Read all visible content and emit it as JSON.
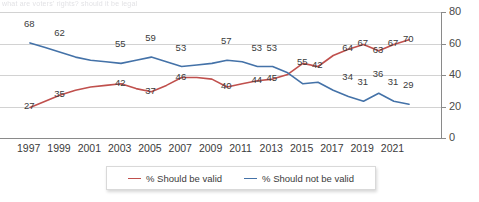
{
  "headline": "what are voters' rights? should it be legal",
  "chart_data": {
    "type": "line",
    "title": "",
    "xlabel": "",
    "ylabel": "",
    "ylim": [
      0,
      80
    ],
    "yticks": [
      0,
      20,
      40,
      60,
      80
    ],
    "grid": true,
    "legend_position": "bottom",
    "x": [
      1997,
      1998,
      1999,
      2000,
      2001,
      2002,
      2003,
      2004,
      2005,
      2006,
      2007,
      2008,
      2009,
      2010,
      2011,
      2012,
      2013,
      2014,
      2015,
      2016,
      2017,
      2018,
      2019,
      2020,
      2021,
      2022
    ],
    "xtick_labels": [
      "1997",
      "1999",
      "2001",
      "2003",
      "2005",
      "2007",
      "2009",
      "2011",
      "2013",
      "2015",
      "2017",
      "2019",
      "2021"
    ],
    "series": [
      {
        "name": "% Should be valid",
        "color": "#c0504d",
        "values": [
          27,
          31,
          35,
          38,
          40,
          41,
          42,
          39,
          37,
          41,
          46,
          46,
          45,
          40,
          42,
          44,
          45,
          48,
          55,
          53,
          60,
          64,
          67,
          63,
          67,
          70
        ],
        "point_labels": [
          {
            "x": 1997,
            "y": 27,
            "text": "27"
          },
          {
            "x": 1999,
            "y": 35,
            "text": "35"
          },
          {
            "x": 2003,
            "y": 42,
            "text": "42"
          },
          {
            "x": 2005,
            "y": 37,
            "text": "37"
          },
          {
            "x": 2007,
            "y": 46,
            "text": "46"
          },
          {
            "x": 2010,
            "y": 40,
            "text": "40"
          },
          {
            "x": 2012,
            "y": 44,
            "text": "44"
          },
          {
            "x": 2013,
            "y": 45,
            "text": "45"
          },
          {
            "x": 2015,
            "y": 55,
            "text": "55"
          },
          {
            "x": 2018,
            "y": 64,
            "text": "64"
          },
          {
            "x": 2019,
            "y": 67,
            "text": "67"
          },
          {
            "x": 2020,
            "y": 63,
            "text": "63"
          },
          {
            "x": 2021,
            "y": 67,
            "text": "67"
          },
          {
            "x": 2022,
            "y": 70,
            "text": "70"
          }
        ]
      },
      {
        "name": "% Should not be valid",
        "color": "#4472a8",
        "values": [
          68,
          65,
          62,
          59,
          57,
          56,
          55,
          57,
          59,
          56,
          53,
          54,
          55,
          57,
          56,
          53,
          53,
          49,
          42,
          43,
          38,
          34,
          31,
          36,
          31,
          29
        ],
        "point_labels": [
          {
            "x": 1997,
            "y": 68,
            "text": "68"
          },
          {
            "x": 1999,
            "y": 62,
            "text": "62"
          },
          {
            "x": 2003,
            "y": 55,
            "text": "55"
          },
          {
            "x": 2005,
            "y": 59,
            "text": "59"
          },
          {
            "x": 2007,
            "y": 53,
            "text": "53"
          },
          {
            "x": 2010,
            "y": 57,
            "text": "57"
          },
          {
            "x": 2012,
            "y": 53,
            "text": "53"
          },
          {
            "x": 2013,
            "y": 53,
            "text": "53"
          },
          {
            "x": 2016,
            "y": 42,
            "text": "42"
          },
          {
            "x": 2018,
            "y": 34,
            "text": "34"
          },
          {
            "x": 2019,
            "y": 31,
            "text": "31"
          },
          {
            "x": 2020,
            "y": 36,
            "text": "36"
          },
          {
            "x": 2021,
            "y": 31,
            "text": "31"
          },
          {
            "x": 2022,
            "y": 29,
            "text": "29"
          }
        ]
      }
    ]
  },
  "legend": {
    "items": [
      {
        "label": "% Should be valid",
        "color": "#c0504d"
      },
      {
        "label": "% Should not be valid",
        "color": "#4472a8"
      }
    ]
  }
}
